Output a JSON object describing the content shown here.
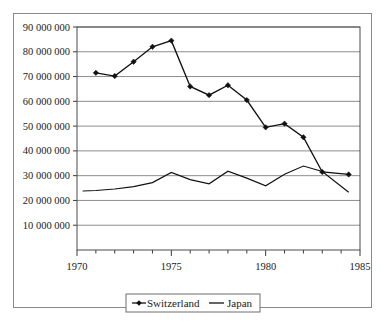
{
  "chart_data": {
    "type": "line",
    "title": "",
    "subtitle": "",
    "xlabel": "",
    "ylabel": "",
    "xlim": [
      1970,
      1985
    ],
    "ylim": [
      0,
      90000000
    ],
    "grid": true,
    "grid_axis": "y",
    "legend_position": "bottom",
    "x_ticks": [
      1970,
      1975,
      1980,
      1985
    ],
    "x_tick_labels": [
      "1970",
      "1975",
      "1980",
      "1985"
    ],
    "x_minor_ticks": [
      1971,
      1972,
      1973,
      1974,
      1976,
      1977,
      1978,
      1979,
      1981,
      1982,
      1983,
      1984
    ],
    "y_ticks": [
      10000000,
      20000000,
      30000000,
      40000000,
      50000000,
      60000000,
      70000000,
      80000000,
      90000000
    ],
    "y_tick_labels": [
      "10 000 000",
      "20 000 000",
      "30 000 000",
      "40 000 000",
      "50 000 000",
      "60 000 000",
      "70 000 000",
      "80 000 000",
      "90 000 000"
    ],
    "series": [
      {
        "name": "Switzerland",
        "marker": "diamond",
        "color": "#111111",
        "x": [
          1971,
          1972,
          1973,
          1974,
          1975,
          1976,
          1977,
          1978,
          1979,
          1980,
          1981,
          1982,
          1983,
          1984.4
        ],
        "values": [
          71500000,
          70200000,
          76000000,
          82000000,
          84500000,
          66000000,
          62500000,
          66500000,
          60500000,
          49500000,
          51000000,
          45500000,
          31500000,
          30500000
        ]
      },
      {
        "name": "Japan",
        "marker": "none",
        "color": "#111111",
        "x": [
          1970.3,
          1971,
          1972,
          1973,
          1974,
          1975,
          1976,
          1977,
          1978,
          1979,
          1980,
          1981,
          1982,
          1983,
          1984.4
        ],
        "values": [
          23800000,
          24000000,
          24600000,
          25600000,
          27200000,
          31300000,
          28400000,
          26700000,
          31800000,
          29000000,
          25900000,
          30600000,
          33900000,
          31700000,
          23300000
        ]
      }
    ]
  },
  "legend": {
    "entries": [
      {
        "label": "Switzerland",
        "marker": "diamond-line"
      },
      {
        "label": "Japan",
        "marker": "line"
      }
    ]
  }
}
